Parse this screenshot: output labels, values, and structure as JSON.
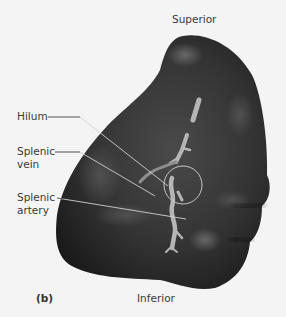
{
  "figure": {
    "panel_label": "(b)",
    "orientation": {
      "top": "Superior",
      "bottom": "Inferior"
    },
    "labels": [
      {
        "id": "hilum",
        "text": "Hilum"
      },
      {
        "id": "splenic-vein",
        "line1": "Splenic",
        "line2": "vein"
      },
      {
        "id": "splenic-artery",
        "line1": "Splenic",
        "line2": "artery"
      }
    ],
    "colors": {
      "background": "#f4f4f4",
      "organ_dark": "#1e1e1e",
      "organ_mid": "#3c3c3c",
      "organ_highlight": "#6a6a6a",
      "vessel": "#b8b8b8",
      "leader_line": "#c8c8c8",
      "text": "#3a3a3a"
    }
  }
}
